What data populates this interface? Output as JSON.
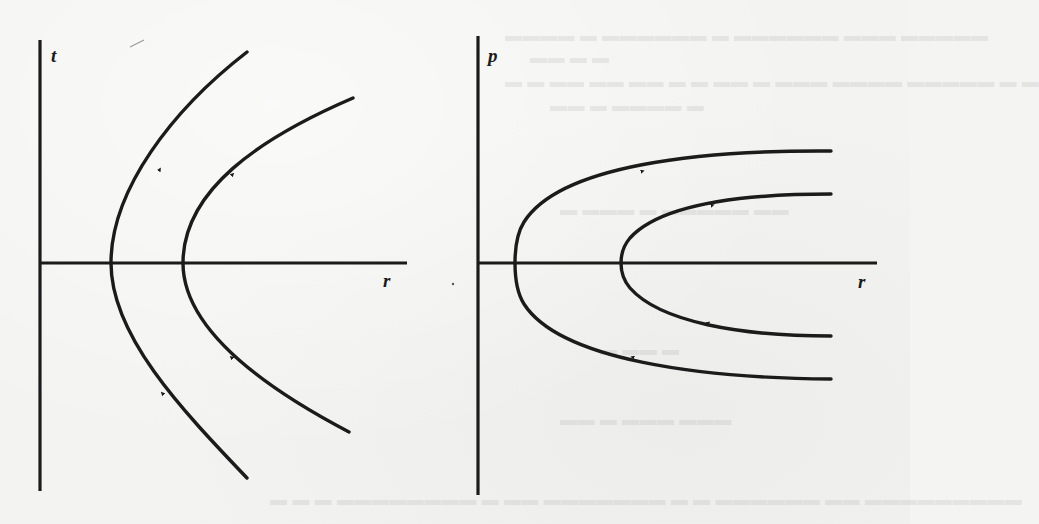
{
  "figure": {
    "ink_color": "#1b1b1b",
    "paper_color": "#f3f3f1",
    "panels": [
      {
        "id": "left",
        "vertical_axis_label": "t",
        "horizontal_axis_label": "r",
        "curves": [
          {
            "name": "inner-hyperbola",
            "vertex_r_px": 111,
            "direction": "upward",
            "arrows": 2
          },
          {
            "name": "outer-hyperbola",
            "vertex_r_px": 183,
            "direction": "upward",
            "arrows": 2
          }
        ]
      },
      {
        "id": "right",
        "vertical_axis_label": "p",
        "horizontal_axis_label": "r",
        "curves": [
          {
            "name": "outer-hyperbola",
            "vertex_r_px": 514,
            "direction": "incoming below, outgoing above",
            "arrows": 2
          },
          {
            "name": "inner-hyperbola",
            "vertex_r_px": 621,
            "direction": "incoming below, outgoing above",
            "arrows": 2
          }
        ]
      }
    ]
  }
}
